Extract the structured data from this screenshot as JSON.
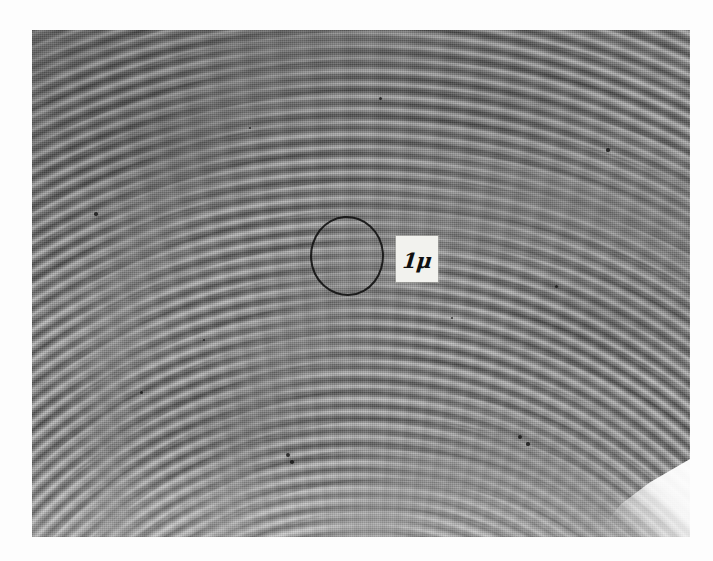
{
  "figure": {
    "kind": "electron-micrograph",
    "caption": ""
  },
  "plate": {
    "background_color": "#8a8a8a",
    "page_background_color": "#fdfdfd",
    "frame": {
      "left_px": 32,
      "top_px": 30,
      "width_px": 658,
      "height_px": 507
    },
    "texture": {
      "pattern": "concentric lamellae",
      "band_spacing_px": 9,
      "arc_center_hint": "below bottom edge, near horizontal centre"
    },
    "artifacts": {
      "corner_flare": "bright white wedge, bottom-right corner",
      "specks": "scattered dark emulsion specks"
    }
  },
  "annotations": {
    "circle": {
      "name": "region-of-interest circle",
      "color": "#141414",
      "center_x_px": 347,
      "center_y_px": 256,
      "radius_px": 37,
      "stroke_px": 2.6
    },
    "scale_label": {
      "text": "1μ",
      "value": "1",
      "unit": "μ",
      "unit_name": "micron",
      "box_color": "#f2f2ee",
      "text_color": "#101010",
      "left_px": 396,
      "top_px": 236,
      "width_px": 42,
      "height_px": 46
    }
  },
  "specks": [
    {
      "x": 288,
      "y": 455,
      "r": 2.4
    },
    {
      "x": 292,
      "y": 462,
      "r": 1.8
    },
    {
      "x": 520,
      "y": 437,
      "r": 2.2
    },
    {
      "x": 528,
      "y": 444,
      "r": 1.6
    },
    {
      "x": 141,
      "y": 392,
      "r": 1.5
    },
    {
      "x": 204,
      "y": 340,
      "r": 1.4
    },
    {
      "x": 608,
      "y": 150,
      "r": 1.6
    },
    {
      "x": 380,
      "y": 98,
      "r": 1.5
    },
    {
      "x": 96,
      "y": 214,
      "r": 1.7
    },
    {
      "x": 452,
      "y": 318,
      "r": 1.4
    },
    {
      "x": 250,
      "y": 128,
      "r": 1.3
    },
    {
      "x": 556,
      "y": 286,
      "r": 1.5
    }
  ]
}
